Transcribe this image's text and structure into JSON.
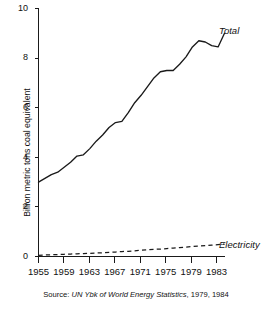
{
  "chart_data": {
    "type": "line",
    "title": "",
    "subtitle": "",
    "xlabel": "",
    "ylabel": "Billion metric tons coal equivalent",
    "xlim": [
      1955,
      1984
    ],
    "ylim": [
      0,
      10
    ],
    "grid": false,
    "legend_position": "inline-right-of-series",
    "x_ticks": [
      "1955",
      "1959",
      "1963",
      "1967",
      "1971",
      "1975",
      "1979",
      "1983"
    ],
    "x_tick_values": [
      1955,
      1959,
      1963,
      1967,
      1971,
      1975,
      1979,
      1983
    ],
    "y_ticks": [
      "0",
      "2",
      "4",
      "6",
      "8",
      "10"
    ],
    "y_tick_values": [
      0,
      2,
      4,
      6,
      8,
      10
    ],
    "x": [
      1955,
      1956,
      1957,
      1958,
      1959,
      1960,
      1961,
      1962,
      1963,
      1964,
      1965,
      1966,
      1967,
      1968,
      1969,
      1970,
      1971,
      1972,
      1973,
      1974,
      1975,
      1976,
      1977,
      1978,
      1979,
      1980,
      1981,
      1982,
      1983,
      1984
    ],
    "series": [
      {
        "name": "Total",
        "style": "solid",
        "values": [
          3.0,
          3.15,
          3.3,
          3.4,
          3.6,
          3.8,
          4.05,
          4.1,
          4.35,
          4.65,
          4.9,
          5.2,
          5.4,
          5.45,
          5.8,
          6.2,
          6.5,
          6.85,
          7.2,
          7.45,
          7.5,
          7.5,
          7.75,
          8.05,
          8.45,
          8.7,
          8.65,
          8.5,
          8.45,
          9.0
        ]
      },
      {
        "name": "Electricity",
        "style": "dashed",
        "values": [
          0.05,
          0.06,
          0.07,
          0.08,
          0.09,
          0.1,
          0.11,
          0.12,
          0.13,
          0.14,
          0.15,
          0.17,
          0.18,
          0.2,
          0.21,
          0.23,
          0.25,
          0.27,
          0.29,
          0.3,
          0.32,
          0.34,
          0.36,
          0.38,
          0.4,
          0.42,
          0.44,
          0.46,
          0.48,
          0.5
        ]
      }
    ],
    "annotations": [
      {
        "text": "Total",
        "series": "Total"
      },
      {
        "text": "Electricity",
        "series": "Electricity"
      }
    ],
    "source": {
      "prefix": "Source:",
      "title": "UN Ybk of World Energy Statistics",
      "years": ", 1979, 1984",
      "full": "Source: UN Ybk of World Energy Statistics, 1979, 1984"
    }
  },
  "colors": {
    "ink": "#1a1a1a",
    "background": "#ffffff"
  }
}
